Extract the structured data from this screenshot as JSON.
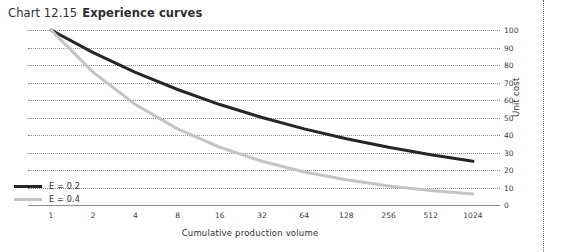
{
  "title": {
    "number": "Chart 12.15",
    "name": "Experience curves"
  },
  "chart_data": {
    "type": "line",
    "xlabel": "Cumulative production volume",
    "ylabel": "Unit cost",
    "x_scale": "log2",
    "x": [
      1,
      2,
      4,
      8,
      16,
      32,
      64,
      128,
      256,
      512,
      1024
    ],
    "xtick_labels": [
      "1",
      "2",
      "4",
      "8",
      "16",
      "32",
      "64",
      "128",
      "256",
      "512",
      "1024"
    ],
    "ylim": [
      0,
      100
    ],
    "yticks": [
      0,
      10,
      20,
      30,
      40,
      50,
      60,
      70,
      80,
      90,
      100
    ],
    "ytick_labels": [
      "0",
      "10",
      "20",
      "30",
      "40",
      "50",
      "60",
      "70",
      "80",
      "90",
      "100"
    ],
    "ytick_side": "right",
    "grid": true,
    "grid_style": "dotted-horizontal",
    "legend_position": "inside-bottom-left",
    "series": [
      {
        "name": "E = 0.2",
        "color": "#262626",
        "width": 3.0,
        "exponent": 0.2,
        "values": [
          100.0,
          87.1,
          75.8,
          66.0,
          57.4,
          50.0,
          43.5,
          37.9,
          33.0,
          28.7,
          25.0
        ]
      },
      {
        "name": "E = 0.4",
        "color": "#c4c4c4",
        "width": 3.0,
        "exponent": 0.4,
        "values": [
          100.0,
          75.8,
          57.4,
          43.5,
          33.0,
          25.0,
          18.9,
          14.4,
          10.9,
          8.3,
          6.3
        ]
      }
    ]
  },
  "legend": {
    "items": [
      {
        "label": "E = 0.2",
        "color": "#262626"
      },
      {
        "label": "E = 0.4",
        "color": "#c4c4c4"
      }
    ]
  },
  "colors": {
    "grid": "#8d8d8d",
    "axis": "#8d8d8d",
    "text": "#2e2e2e",
    "separator": "#6f6f6f"
  }
}
